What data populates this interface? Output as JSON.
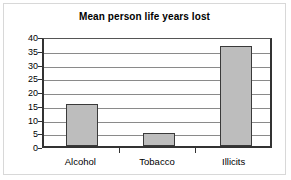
{
  "chart_data": {
    "type": "bar",
    "title": "Mean person life years lost",
    "categories": [
      "Alcohol",
      "Tobacco",
      "Illicits"
    ],
    "values": [
      15.2,
      4.8,
      36.5
    ],
    "xlabel": "",
    "ylabel": "",
    "ylim": [
      0,
      40
    ],
    "yticks": [
      0,
      5,
      10,
      15,
      20,
      25,
      30,
      35,
      40
    ],
    "ytick_labels": [
      "0",
      "5",
      "10",
      "15",
      "20",
      "25",
      "30",
      "35",
      "40"
    ],
    "grid": true,
    "legend": false,
    "bar_color": "#bdbdbd",
    "bar_border_color": "#3a3a3a",
    "gridline_color": "#8a8a8a",
    "axis_color": "#333333"
  }
}
